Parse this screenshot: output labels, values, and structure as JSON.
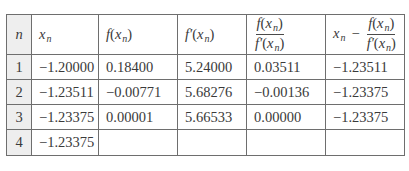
{
  "table": {
    "headers": {
      "n": "n",
      "xn": "x",
      "xn_sub": "n",
      "f_xn": {
        "func": "f",
        "arg": "x",
        "sub": "n"
      },
      "fprime_xn": {
        "func": "f′",
        "arg": "x",
        "sub": "n"
      },
      "ratio": {
        "num": {
          "func": "f",
          "arg": "x",
          "sub": "n"
        },
        "den": {
          "func": "f′",
          "arg": "x",
          "sub": "n"
        }
      },
      "update": {
        "lead": "x",
        "lead_sub": "n",
        "op": "−",
        "num": {
          "func": "f",
          "arg": "x",
          "sub": "n"
        },
        "den": {
          "func": "f′",
          "arg": "x",
          "sub": "n"
        }
      }
    },
    "rows": [
      {
        "n": "1",
        "xn": "−1.20000",
        "f": "0.18400",
        "fp": "5.24000",
        "ratio": "0.03511",
        "next": "−1.23511"
      },
      {
        "n": "2",
        "xn": "−1.23511",
        "f": "−0.00771",
        "fp": "5.68276",
        "ratio": "−0.00136",
        "next": "−1.23375"
      },
      {
        "n": "3",
        "xn": "−1.23375",
        "f": "0.00001",
        "fp": "5.66533",
        "ratio": "0.00000",
        "next": "−1.23375"
      },
      {
        "n": "4",
        "xn": "−1.23375",
        "f": "",
        "fp": "",
        "ratio": "",
        "next": ""
      }
    ]
  }
}
